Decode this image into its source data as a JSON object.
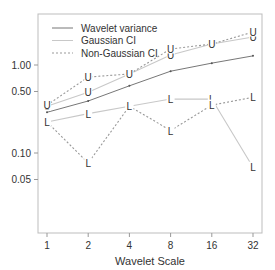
{
  "chart_data": {
    "type": "line",
    "title": "",
    "xlabel": "Wavelet Scale",
    "ylabel": "",
    "x": [
      1,
      2,
      4,
      8,
      16,
      32
    ],
    "x_tick_labels": [
      "1",
      "2",
      "4",
      "8",
      "16",
      "32"
    ],
    "y_scale": "log",
    "y_ticks": [
      0.05,
      0.1,
      0.5,
      1.0
    ],
    "y_tick_labels": [
      "0.05",
      "0.10",
      "0.50",
      "1.00"
    ],
    "ylim": [
      0.03,
      3.3
    ],
    "grid": false,
    "legend_position": "top-left inside",
    "legend": [
      "Wavelet variance",
      "Gaussian CI",
      "Non-Gaussian CI"
    ],
    "series": [
      {
        "name": "Wavelet variance",
        "style": "solid",
        "color": "#777777",
        "marker": "dot",
        "values": [
          0.29,
          0.39,
          0.58,
          0.85,
          1.05,
          1.27
        ]
      },
      {
        "name": "Gaussian CI upper",
        "group": "Gaussian CI",
        "style": "solid",
        "color": "#c8c8c8",
        "marker": "U",
        "values": [
          0.34,
          0.49,
          0.79,
          1.3,
          1.73,
          2.08
        ]
      },
      {
        "name": "Gaussian CI lower",
        "group": "Gaussian CI",
        "style": "solid",
        "color": "#c8c8c8",
        "marker": "L",
        "values": [
          0.225,
          0.28,
          0.34,
          0.41,
          0.41,
          0.069
        ]
      },
      {
        "name": "Non-Gaussian CI upper",
        "group": "Non-Gaussian CI",
        "style": "dashed",
        "color": "#999999",
        "marker": "U",
        "values": [
          0.35,
          0.73,
          0.79,
          1.52,
          1.73,
          2.37
        ]
      },
      {
        "name": "Non-Gaussian CI lower",
        "group": "Non-Gaussian CI",
        "style": "dashed",
        "color": "#999999",
        "marker": "L",
        "values": [
          0.225,
          0.077,
          0.34,
          0.18,
          0.35,
          0.43
        ]
      }
    ]
  }
}
